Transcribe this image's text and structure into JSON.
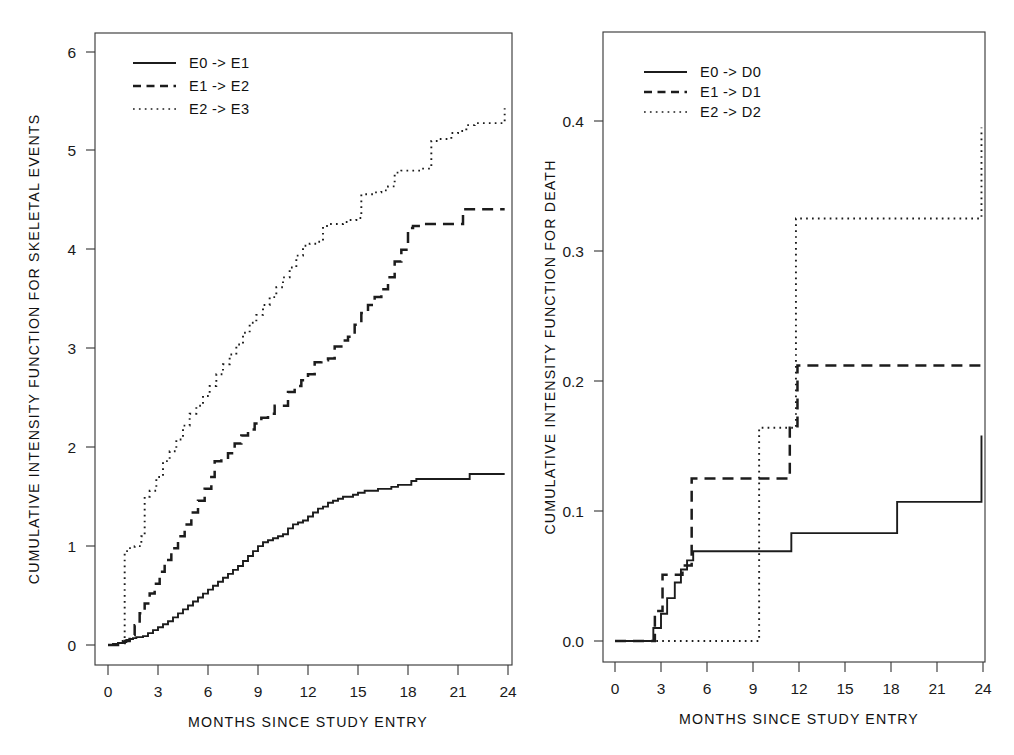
{
  "figure": {
    "panels": [
      {
        "name": "skeletal-events",
        "xlabel": "MONTHS SINCE STUDY ENTRY",
        "ylabel": "CUMULATIVE INTENSITY FUNCTION FOR SKELETAL EVENTS",
        "xticks": [
          "0",
          "3",
          "6",
          "9",
          "12",
          "15",
          "18",
          "21",
          "24"
        ],
        "yticks": [
          "0",
          "1",
          "2",
          "3",
          "4",
          "5",
          "6"
        ],
        "legend": [
          "E0 -> E1",
          "E1 -> E2",
          "E2 -> E3"
        ]
      },
      {
        "name": "death",
        "xlabel": "MONTHS SINCE STUDY ENTRY",
        "ylabel": "CUMULATIVE INTENSITY FUNCTION FOR DEATH",
        "xticks": [
          "0",
          "3",
          "6",
          "9",
          "12",
          "15",
          "18",
          "21",
          "24"
        ],
        "yticks": [
          "0.0",
          "0.1",
          "0.2",
          "0.3",
          "0.4"
        ],
        "legend": [
          "E0 -> D0",
          "E1 -> D1",
          "E2 -> D2"
        ]
      }
    ]
  },
  "chart_data": [
    {
      "type": "line",
      "name": "skeletal-events",
      "title": "",
      "xlabel": "MONTHS SINCE STUDY ENTRY",
      "ylabel": "CUMULATIVE INTENSITY FUNCTION FOR SKELETAL EVENTS",
      "xlim": [
        -0.8,
        25.2
      ],
      "ylim": [
        -0.22,
        6.22
      ],
      "xticks": [
        0,
        3,
        6,
        9,
        12,
        15,
        18,
        21,
        24
      ],
      "yticks": [
        0,
        1,
        2,
        3,
        4,
        5,
        6
      ],
      "grid": false,
      "legend_position": "top-left",
      "step": "post",
      "series": [
        {
          "name": "E0 -> E1",
          "style": "solid",
          "x": [
            0,
            0.3,
            0.6,
            0.9,
            1.1,
            1.3,
            1.5,
            1.7,
            1.9,
            2.1,
            2.4,
            2.7,
            3.0,
            3.3,
            3.6,
            3.9,
            4.2,
            4.5,
            4.8,
            5.1,
            5.4,
            5.7,
            6.0,
            6.3,
            6.6,
            6.9,
            7.2,
            7.5,
            7.8,
            8.1,
            8.4,
            8.7,
            9.0,
            9.3,
            9.6,
            9.9,
            10.2,
            10.5,
            10.8,
            11.1,
            11.4,
            11.7,
            12.0,
            12.3,
            12.6,
            12.9,
            13.2,
            13.5,
            13.8,
            14.1,
            14.4,
            14.7,
            15.0,
            15.4,
            15.8,
            16.2,
            16.6,
            17.0,
            17.4,
            17.8,
            18.2,
            18.5,
            21.3,
            21.7,
            23.8
          ],
          "y": [
            0.0,
            0.01,
            0.02,
            0.03,
            0.05,
            0.06,
            0.07,
            0.08,
            0.08,
            0.09,
            0.12,
            0.15,
            0.18,
            0.21,
            0.24,
            0.28,
            0.32,
            0.36,
            0.4,
            0.44,
            0.48,
            0.52,
            0.56,
            0.6,
            0.64,
            0.68,
            0.72,
            0.76,
            0.8,
            0.85,
            0.9,
            0.95,
            1.0,
            1.04,
            1.06,
            1.08,
            1.1,
            1.12,
            1.18,
            1.22,
            1.24,
            1.26,
            1.3,
            1.34,
            1.38,
            1.4,
            1.44,
            1.46,
            1.48,
            1.5,
            1.5,
            1.52,
            1.54,
            1.56,
            1.56,
            1.58,
            1.58,
            1.6,
            1.62,
            1.62,
            1.66,
            1.68,
            1.68,
            1.73,
            1.73
          ]
        },
        {
          "name": "E1 -> E2",
          "style": "dashed",
          "x": [
            0,
            0.6,
            1.0,
            1.3,
            1.6,
            1.9,
            2.2,
            2.5,
            2.8,
            3.1,
            3.4,
            3.8,
            4.2,
            4.6,
            5.0,
            5.4,
            5.8,
            6.2,
            6.4,
            6.8,
            7.2,
            7.6,
            8.0,
            8.4,
            8.8,
            9.2,
            9.6,
            10.0,
            10.4,
            10.8,
            11.2,
            11.6,
            12.0,
            12.4,
            12.8,
            13.2,
            13.6,
            14.0,
            14.4,
            14.8,
            15.2,
            15.6,
            16.0,
            16.4,
            16.8,
            17.2,
            17.6,
            18.0,
            18.3,
            18.6,
            18.9,
            21.0,
            21.3,
            23.8
          ],
          "y": [
            0.0,
            0.02,
            0.04,
            0.1,
            0.2,
            0.32,
            0.42,
            0.52,
            0.62,
            0.74,
            0.86,
            0.98,
            1.1,
            1.22,
            1.34,
            1.46,
            1.58,
            1.7,
            1.86,
            1.88,
            1.94,
            2.04,
            2.12,
            2.18,
            2.24,
            2.3,
            2.34,
            2.42,
            2.42,
            2.56,
            2.62,
            2.68,
            2.74,
            2.86,
            2.88,
            2.9,
            3.02,
            3.08,
            3.12,
            3.24,
            3.36,
            3.44,
            3.52,
            3.6,
            3.72,
            3.88,
            4.0,
            4.22,
            4.24,
            4.24,
            4.26,
            4.26,
            4.41,
            4.41
          ]
        },
        {
          "name": "E2 -> E3",
          "style": "dotted",
          "x": [
            0,
            0.4,
            0.8,
            1.0,
            1.25,
            1.6,
            2.0,
            2.2,
            2.5,
            2.9,
            3.3,
            3.7,
            4.1,
            4.5,
            4.9,
            5.3,
            5.7,
            6.1,
            6.5,
            6.9,
            7.3,
            7.7,
            8.1,
            8.5,
            8.9,
            9.3,
            9.7,
            10.1,
            10.5,
            10.9,
            11.3,
            11.7,
            12.1,
            12.5,
            12.9,
            13.3,
            13.7,
            14.1,
            14.5,
            14.9,
            15.2,
            15.6,
            16.0,
            16.4,
            16.8,
            17.2,
            17.6,
            18.0,
            18.4,
            18.8,
            19.4,
            19.8,
            20.6,
            21.0,
            21.5,
            22.0,
            23.3,
            23.8
          ],
          "y": [
            0.0,
            0.02,
            0.04,
            0.95,
            0.98,
            1.0,
            1.1,
            1.5,
            1.56,
            1.7,
            1.86,
            1.96,
            2.08,
            2.22,
            2.34,
            2.42,
            2.52,
            2.62,
            2.74,
            2.84,
            2.94,
            3.04,
            3.16,
            3.26,
            3.34,
            3.44,
            3.52,
            3.62,
            3.72,
            3.82,
            3.94,
            4.04,
            4.06,
            4.08,
            4.24,
            4.26,
            4.26,
            4.28,
            4.3,
            4.32,
            4.56,
            4.56,
            4.58,
            4.6,
            4.64,
            4.78,
            4.8,
            4.8,
            4.8,
            4.82,
            5.1,
            5.12,
            5.18,
            5.2,
            5.26,
            5.28,
            5.28,
            5.43
          ]
        }
      ]
    },
    {
      "type": "line",
      "name": "death",
      "title": "",
      "xlabel": "MONTHS SINCE STUDY ENTRY",
      "ylabel": "CUMULATIVE INTENSITY FUNCTION FOR DEATH",
      "xlim": [
        -0.8,
        25.2
      ],
      "ylim": [
        -0.015,
        0.455
      ],
      "xticks": [
        0,
        3,
        6,
        9,
        12,
        15,
        18,
        21,
        24
      ],
      "yticks": [
        0.0,
        0.1,
        0.2,
        0.3,
        0.4
      ],
      "grid": false,
      "legend_position": "top-left",
      "step": "post",
      "series": [
        {
          "name": "E0 -> D0",
          "style": "solid",
          "x": [
            0,
            1.9,
            2.5,
            3.0,
            3.4,
            3.9,
            4.3,
            4.7,
            5.1,
            6.0,
            11.5,
            18.4,
            23.9
          ],
          "y": [
            0.0,
            0.0,
            0.01,
            0.021,
            0.033,
            0.045,
            0.055,
            0.062,
            0.069,
            0.069,
            0.083,
            0.107,
            0.158
          ]
        },
        {
          "name": "E1 -> D1",
          "style": "dashed",
          "x": [
            0,
            2.1,
            2.6,
            3.1,
            4.4,
            5.0,
            9.0,
            11.4,
            11.9,
            23.9
          ],
          "y": [
            0.0,
            0.0,
            0.023,
            0.051,
            0.058,
            0.125,
            0.125,
            0.164,
            0.212,
            0.212
          ]
        },
        {
          "name": "E2 -> D2",
          "style": "dotted",
          "x": [
            0,
            5.1,
            9.4,
            11.3,
            11.8,
            23.9
          ],
          "y": [
            0.0,
            0.0,
            0.164,
            0.164,
            0.325,
            0.395
          ]
        }
      ]
    }
  ]
}
